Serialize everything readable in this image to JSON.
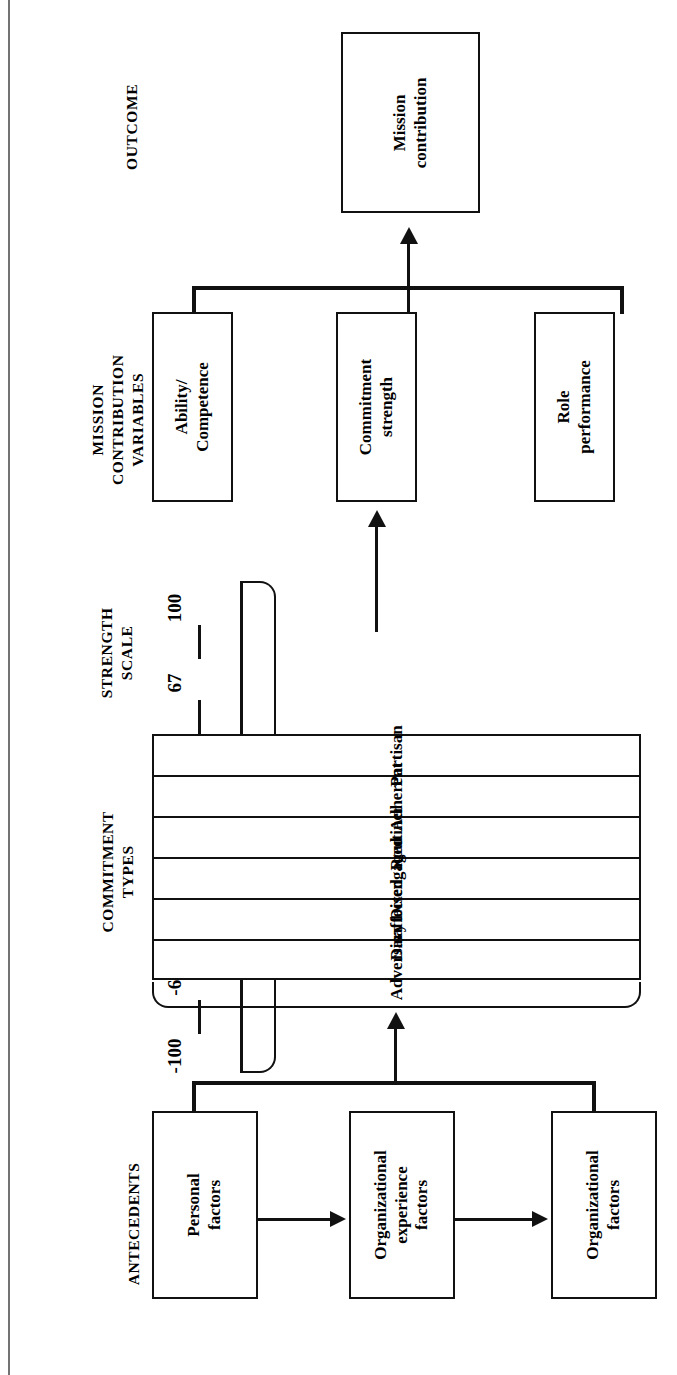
{
  "figure": {
    "orientation": "rotated-90-ccw",
    "ink_color": "#111111",
    "background_color": "#ffffff"
  },
  "bands": {
    "outcome": {
      "title": "OUTCOME"
    },
    "mission_contribution_variables": {
      "title_line1": "MISSION",
      "title_line2": "CONTRIBUTION",
      "title_line3": "VARIABLES"
    },
    "strength_scale": {
      "title_line1": "STRENGTH",
      "title_line2": "SCALE"
    },
    "commitment_types": {
      "title_line1": "COMMITMENT",
      "title_line2": "TYPES"
    },
    "antecedents": {
      "title": "ANTECEDENTS"
    }
  },
  "outcome_box": {
    "label": "Mission\ncontribution"
  },
  "mission_contribution_boxes": [
    {
      "label": "Ability/\nCompetence"
    },
    {
      "label": "Commitment\nstrength"
    },
    {
      "label": "Role\nperformance"
    }
  ],
  "strength_scale_ticks": [
    "100",
    "67",
    "33",
    "0",
    "-33",
    "-67",
    "-100"
  ],
  "commitment_types": [
    "Partisan",
    "Adherent",
    "Routiner",
    "Disengaged",
    "Disaffected",
    "Adversary"
  ],
  "antecedent_boxes": [
    {
      "label": "Personal\nfactors"
    },
    {
      "label": "Organizational\nexperience\nfactors"
    },
    {
      "label": "Organizational\nfactors"
    }
  ],
  "chart_data": {
    "type": "diagram",
    "bands": [
      "ANTECEDENTS",
      "COMMITMENT TYPES",
      "STRENGTH SCALE",
      "MISSION CONTRIBUTION VARIABLES",
      "OUTCOME"
    ],
    "scale_values": [
      100,
      67,
      33,
      0,
      -33,
      -67,
      -100
    ],
    "scale_range": [
      -100,
      100
    ],
    "commitment_types_ordered_high_to_low": [
      "Partisan",
      "Adherent",
      "Routiner",
      "Disengaged",
      "Disaffected",
      "Adversary"
    ],
    "nodes": [
      "Personal factors",
      "Organizational experience factors",
      "Organizational factors",
      "Ability/Competence",
      "Commitment strength",
      "Role performance",
      "Mission contribution"
    ],
    "edges": [
      "Personal factors -> Organizational experience factors",
      "Organizational experience factors -> Organizational factors",
      "Antecedents (grouped) -> Commitment types",
      "Commitment types / Strength scale -> Commitment strength",
      "Mission contribution variables (grouped) -> Mission contribution"
    ]
  }
}
